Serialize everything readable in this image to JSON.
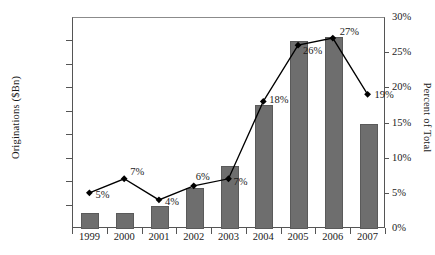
{
  "chart_data": {
    "type": "bar",
    "title": "",
    "xlabel": "",
    "ylabel": "Originations ($Bn)",
    "y2label": "Percent of Total",
    "categories": [
      "1999",
      "2000",
      "2001",
      "2002",
      "2003",
      "2004",
      "2005",
      "2006",
      "2007"
    ],
    "ylim": [
      0,
      900
    ],
    "y2lim": [
      0,
      30
    ],
    "ytick_labels": [
      "$0",
      "$100",
      "$200",
      "$300",
      "$400",
      "$500",
      "$600",
      "$700",
      "$800",
      "$900"
    ],
    "ytick_values": [
      0,
      100,
      200,
      300,
      400,
      500,
      600,
      700,
      800,
      900
    ],
    "y2tick_labels": [
      "0%",
      "5%",
      "10%",
      "15%",
      "20%",
      "25%",
      "30%"
    ],
    "y2tick_values": [
      0,
      5,
      10,
      15,
      20,
      25,
      30
    ],
    "grid": false,
    "legend": false,
    "series": [
      {
        "name": "Originations ($Bn)",
        "type": "bar",
        "axis": "left",
        "color": "#6e6e6e",
        "values": [
          70,
          70,
          100,
          175,
          270,
          530,
          800,
          820,
          450
        ]
      },
      {
        "name": "Percent of Total",
        "type": "line",
        "axis": "right",
        "color": "#000000",
        "marker": "diamond",
        "values": [
          5,
          7,
          4,
          6,
          7,
          18,
          26,
          27,
          19
        ],
        "data_labels": [
          "5%",
          "7%",
          "4%",
          "6%",
          "7%",
          "18%",
          "26%",
          "27%",
          "19%"
        ]
      }
    ]
  }
}
